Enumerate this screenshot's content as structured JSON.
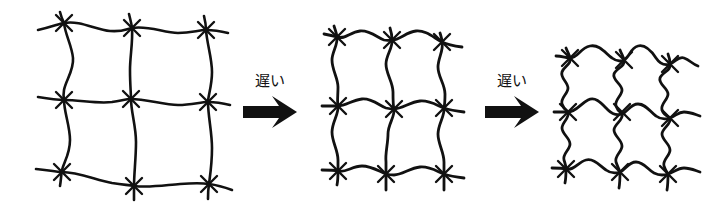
{
  "figure": {
    "background_color": "#ffffff",
    "ink_color": "#111111",
    "width": 728,
    "height": 211
  },
  "stages": [
    {
      "id": "stage-1",
      "name": "extended-network",
      "label": "",
      "description": "Extended square-mesh polymer network with nearly straight strands",
      "node_rows": 3,
      "node_cols": 3,
      "bounds": {
        "x": 40,
        "y": 15,
        "width": 185,
        "height": 180
      },
      "strand_waviness": "low",
      "stroke_width": 2.6
    },
    {
      "id": "stage-2",
      "name": "partially-contracted-network",
      "label": "",
      "description": "Partially contracted network, strands visibly wavy",
      "node_rows": 3,
      "node_cols": 3,
      "bounds": {
        "x": 328,
        "y": 30,
        "width": 145,
        "height": 150
      },
      "strand_waviness": "medium",
      "stroke_width": 2.8
    },
    {
      "id": "stage-3",
      "name": "fully-coiled-network",
      "label": "",
      "description": "Fully relaxed network with strongly coiled, serpentine strands",
      "node_rows": 3,
      "node_cols": 3,
      "bounds": {
        "x": 560,
        "y": 40,
        "width": 140,
        "height": 140
      },
      "strand_waviness": "high",
      "stroke_width": 2.8
    }
  ],
  "transitions": [
    {
      "id": "transition-1",
      "caption": "遅い",
      "caption_romaji": "osoi",
      "caption_meaning": "slow",
      "from": "stage-1",
      "to": "stage-2",
      "arrow": {
        "x1": 243,
        "x2": 297,
        "y": 112
      },
      "caption_position": {
        "x": 270,
        "y": 86
      }
    },
    {
      "id": "transition-2",
      "caption": "遅い",
      "caption_romaji": "osoi",
      "caption_meaning": "slow",
      "from": "stage-2",
      "to": "stage-3",
      "arrow": {
        "x1": 485,
        "x2": 539,
        "y": 112
      },
      "caption_position": {
        "x": 512,
        "y": 86
      }
    }
  ]
}
